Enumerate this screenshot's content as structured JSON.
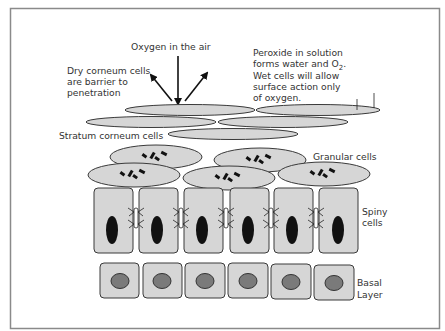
{
  "diagram": {
    "labels": {
      "oxygen": "Oxygen in the air",
      "dry_line1": "Dry corneum cells",
      "dry_line2": "are barrier to",
      "dry_line3": "penetration",
      "peroxide_line1": "Peroxide in solution",
      "peroxide_line2_a": "forms water and O",
      "peroxide_line2_sub": "2",
      "peroxide_line2_b": ".",
      "peroxide_line3": "Wet cells will allow",
      "peroxide_line4": "surface action only",
      "peroxide_line5": "of oxygen.",
      "stratum_corneum": "Stratum corneum cells",
      "granular": "Granular cells",
      "spiny_line1": "Spiny",
      "spiny_line2": "cells",
      "basal_line1": "Basal",
      "basal_line2": "Layer"
    },
    "layers": [
      {
        "name": "Stratum corneum",
        "cell_count": 5,
        "shape": "flat ellipse"
      },
      {
        "name": "Granular",
        "cell_count": 5,
        "shape": "ellipse with granules"
      },
      {
        "name": "Spiny",
        "cell_count": 6,
        "shape": "tall rectangle with dark elongated nucleus"
      },
      {
        "name": "Basal",
        "cell_count": 6,
        "shape": "square with round nucleus"
      }
    ],
    "arrows": [
      {
        "name": "oxygen-down-arrow",
        "direction": "down"
      },
      {
        "name": "reflect-left-arrow",
        "direction": "up-left"
      },
      {
        "name": "reflect-right-arrow",
        "direction": "up-right"
      },
      {
        "name": "surface-small-arrow-1",
        "direction": "down"
      },
      {
        "name": "surface-small-arrow-2",
        "direction": "down"
      }
    ],
    "colors": {
      "cell_fill": "#d6d6d6",
      "outline": "#3a3a3a",
      "nucleus_spiny": "#111111",
      "nucleus_basal": "#7a7a7a",
      "frame": "#8a8a8a"
    }
  }
}
